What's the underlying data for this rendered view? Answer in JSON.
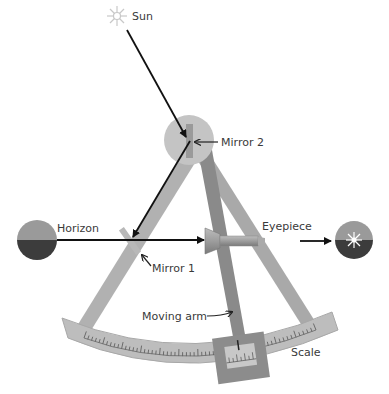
{
  "labels": {
    "sun": "Sun",
    "mirror2": "Mirror 2",
    "horizon": "Horizon",
    "mirror1": "Mirror 1",
    "eyepiece": "Eyepiece",
    "moving_arm": "Moving arm",
    "scale": "Scale"
  },
  "icons": [
    "sun-icon",
    "horizon-globe-icon",
    "view-globe-icon"
  ],
  "colors": {
    "frame": "#a8a8a8",
    "frame_dark": "#8c8c8c",
    "pivot": "#c4c4c4",
    "scale_band": "#bdbdbd",
    "arm": "#8a8a8a",
    "sky": "#9a9a9a",
    "sea": "#3c3c3c",
    "ray": "#111111"
  }
}
